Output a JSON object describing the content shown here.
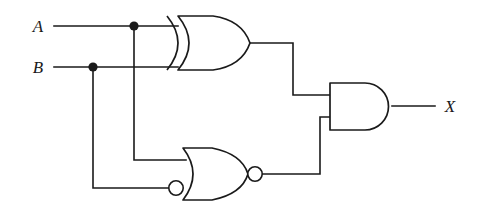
{
  "diagram": {
    "type": "logic-circuit-schematic",
    "background_color": "#ffffff",
    "line_color": "#1a1a1a",
    "width": 488,
    "height": 216
  },
  "inputs": [
    {
      "id": "A",
      "label": "A",
      "label_x": 38,
      "label_y": 32,
      "wire_y": 26,
      "wire_start_x": 54,
      "junction_x": 134
    },
    {
      "id": "B",
      "label": "B",
      "label_x": 38,
      "label_y": 73,
      "wire_y": 67,
      "wire_start_x": 54,
      "junction_x": 93
    }
  ],
  "outputs": [
    {
      "id": "X",
      "label": "X",
      "label_x": 443,
      "label_y": 112,
      "wire_y": 106,
      "wire_end_x": 435
    }
  ],
  "junctions": [
    {
      "id": "node-a",
      "source": "A",
      "x": 134,
      "y": 26,
      "radius": 4.6
    },
    {
      "id": "node-b",
      "source": "B",
      "x": 93,
      "y": 67,
      "radius": 4.6
    }
  ],
  "gates": [
    {
      "id": "xor1",
      "type": "XOR",
      "label": "XOR gate",
      "x": 178,
      "y": 16,
      "width": 72,
      "height": 54,
      "inputs": [
        "A",
        "B"
      ],
      "input_bubbles": [
        false,
        false
      ],
      "output_bubble": false,
      "output_to": "and1.input0"
    },
    {
      "id": "nor1",
      "type": "NOR",
      "label": "NOR gate with inverted lower input",
      "x": 183,
      "y": 148,
      "width": 65,
      "height": 52,
      "inputs": [
        "A",
        "B"
      ],
      "input_bubbles": [
        false,
        true
      ],
      "output_bubble": true,
      "output_to": "and1.input1"
    },
    {
      "id": "and1",
      "type": "AND",
      "label": "AND gate",
      "x": 330,
      "y": 83,
      "width": 62,
      "height": 47,
      "inputs": [
        "xor1",
        "nor1"
      ],
      "input_bubbles": [
        false,
        false
      ],
      "output_bubble": false,
      "output_to": "X"
    }
  ],
  "nets": [
    {
      "id": "net-a-xor",
      "from": "A",
      "to": "xor1.input0",
      "path": "M54,26 L178,26"
    },
    {
      "id": "net-b-xor",
      "from": "B",
      "to": "xor1.input1",
      "path": "M54,67 L178,67"
    },
    {
      "id": "net-a-nor",
      "from": "node-a",
      "to": "nor1.input0",
      "path": "M134,26 L134,160 L186,160"
    },
    {
      "id": "net-b-nor",
      "from": "node-b",
      "to": "nor1.input1-bubble",
      "path": "M93,67 L93,188 L169,188"
    },
    {
      "id": "net-xor-and",
      "from": "xor1.output",
      "to": "and1.input0",
      "path": "M250,43 L293,43 L293,95 L330,95"
    },
    {
      "id": "net-nor-and",
      "from": "nor1.output",
      "to": "and1.input1",
      "path": "M262,174 L320,174 L320,117 L330,117"
    },
    {
      "id": "net-and-x",
      "from": "and1.output",
      "to": "X",
      "path": "M392,106 L435,106"
    }
  ],
  "logic": {
    "expression": "X = (A XOR B) AND NOT(A OR NOT B)",
    "gate_count": 3
  }
}
